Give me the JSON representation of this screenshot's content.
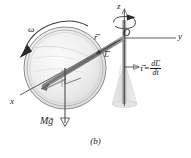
{
  "figure": {
    "caption": "(b)",
    "axes": {
      "z_label": "z",
      "y_label": "y",
      "x_label": "x",
      "origin_label": "O"
    },
    "labels": {
      "omega": "ω",
      "r_symbol": "r",
      "L_symbol": "L",
      "weight_symbol": "Mg",
      "torque_symbol": "τ",
      "equals": "=",
      "derivative_numerator": "dL",
      "derivative_denominator": "dt",
      "vector_arrow": "→"
    },
    "colors": {
      "line": "#4d4d4d",
      "ink": "#1a1a1a",
      "wheel_fill": "#e8e8e8",
      "wheel_rim": "#6b6b6b",
      "shaft": "#8a8a8a",
      "base": "#dcdcdc",
      "accent": "#2b2b2b"
    },
    "elements": {
      "wheel": "spinning-wheel",
      "axle": "axle-rod",
      "support_shaft": "vertical-support-shaft",
      "stand": "conical-stand",
      "right_angle": "right-angle-marker",
      "spin_arrow": "spin-direction-arrow",
      "precession_arrow": "precession-direction-arrow",
      "weight_arrow": "weight-force-arrow",
      "torque_arrow": "torque-direction-arrow"
    }
  }
}
